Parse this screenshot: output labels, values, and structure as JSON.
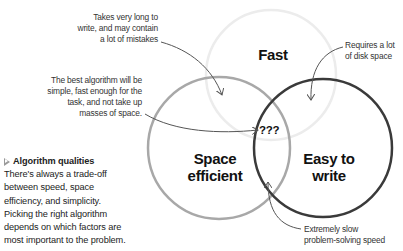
{
  "diagram": {
    "type": "venn",
    "circles": [
      {
        "id": "fast",
        "label": "Fast",
        "stroke": "#ececec",
        "stroke_width": 2.5
      },
      {
        "id": "space",
        "label_line1": "Space",
        "label_line2": "efficient",
        "stroke": "#a8a8a8",
        "stroke_width": 2.5
      },
      {
        "id": "easy",
        "label_line1": "Easy to",
        "label_line2": "write",
        "stroke": "#3a3a3a",
        "stroke_width": 2.5
      }
    ],
    "center_label": "???",
    "arrow_color": "#555555"
  },
  "callouts": {
    "takes_long": {
      "line1": "Takes very long to",
      "line2": "write, and may contain",
      "line3": "a lot of mistakes"
    },
    "best_algorithm": {
      "line1": "The best algorithm will be",
      "line2": "simple, fast enough for the",
      "line3": "task, and not take up",
      "line4": "masses of space."
    },
    "disk_space": {
      "line1": "Requires a lot",
      "line2": "of disk space"
    },
    "slow_speed": {
      "line1": "Extremely slow",
      "line2": "problem-solving speed"
    }
  },
  "caption": {
    "title": "Algorithm qualities",
    "icon": "triangle-right-outline-icon",
    "lines": [
      "There's always a trade-off",
      "between speed, space",
      "efficiency, and simplicity.",
      "Picking the right algorithm",
      "depends on which factors are",
      "most important to the problem."
    ]
  }
}
